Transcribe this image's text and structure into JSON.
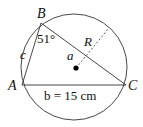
{
  "diagram": {
    "type": "triangle-inscribed-in-circle",
    "vertices": {
      "A": "A",
      "B": "B",
      "C": "C"
    },
    "sides": {
      "a": "a",
      "c": "c",
      "b_label": "b = 15 cm"
    },
    "angle_B": "51°",
    "radius_label": "R",
    "colors": {
      "stroke": "#222222",
      "background": "#ffffff"
    }
  }
}
